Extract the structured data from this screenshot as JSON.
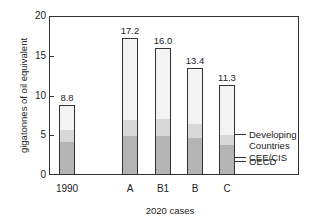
{
  "chart_data": {
    "type": "bar",
    "stacked": true,
    "title": "",
    "xlabel": "2020 cases",
    "ylabel": "gigatonnes of oil equivalent",
    "ylim": [
      0,
      20
    ],
    "yticks": [
      0,
      5,
      10,
      15,
      20
    ],
    "grid": false,
    "categories": [
      "1990",
      "A",
      "B1",
      "B",
      "C"
    ],
    "totals": [
      8.8,
      17.2,
      16.0,
      13.4,
      11.3
    ],
    "total_labels": [
      "8.8",
      "17.2",
      "16.0",
      "13.4",
      "11.3"
    ],
    "series": [
      {
        "name": "OECD",
        "color": "#b4b4b4",
        "values": [
          4.2,
          4.8,
          4.8,
          4.6,
          3.7
        ]
      },
      {
        "name": "CEE/CIS",
        "color": "#d8d8d8",
        "values": [
          1.5,
          2.1,
          2.2,
          1.8,
          1.3
        ]
      },
      {
        "name": "Developing Countries",
        "color": "#f3f3f3",
        "values": [
          3.1,
          10.3,
          9.0,
          7.0,
          6.3
        ]
      }
    ],
    "legend": {
      "position": "right, annotated on last bar",
      "entries": [
        "Developing Countries",
        "CEE/CIS",
        "OECD"
      ]
    }
  },
  "labels": {
    "ylabel": "gigatonnes of oil equivalent",
    "xlabel": "2020 cases",
    "yticks": [
      "0",
      "5",
      "10",
      "15",
      "20"
    ],
    "legend_developing_line1": "Developing",
    "legend_developing_line2": "Countries",
    "legend_cee": "CEE/CIS",
    "legend_oecd": "OECD"
  }
}
